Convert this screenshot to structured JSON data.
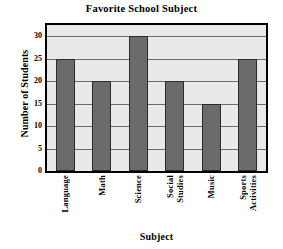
{
  "chart_data": {
    "type": "bar",
    "title": "Favorite School Subject",
    "xlabel": "Subject",
    "ylabel": "Number of Students",
    "categories": [
      "Language",
      "Math",
      "Science",
      "Social Studies",
      "Music",
      "Sports Activities"
    ],
    "category_lines": [
      [
        "Language"
      ],
      [
        "Math"
      ],
      [
        "Science"
      ],
      [
        "Social",
        "Studies"
      ],
      [
        "Music"
      ],
      [
        "Sports",
        "Activities"
      ]
    ],
    "values": [
      25,
      20,
      30,
      20,
      15,
      25
    ],
    "ylim": [
      0,
      32.5
    ],
    "yticks": [
      30,
      25,
      20,
      15,
      10,
      5,
      0
    ],
    "ytick_labels": [
      "30",
      "25",
      "20",
      "15",
      "10",
      "5",
      "0"
    ],
    "grid": true,
    "gridlines_y": [
      30,
      25,
      20,
      15,
      10,
      5
    ],
    "legend": null,
    "colors": {
      "bar_fill": "#6b6b6b",
      "bar_edge": "#2b2b2b",
      "plot_background": "#e9e9e9",
      "gridline": "#6d6d6d",
      "frame": "#000000",
      "text": "#000000",
      "figure_background": "#ffffff"
    }
  }
}
